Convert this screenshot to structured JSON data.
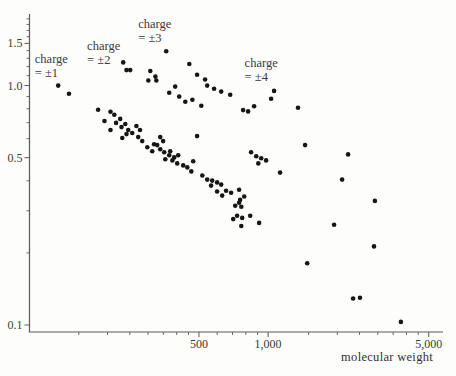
{
  "figure": {
    "background": "#fdfdfb",
    "dot_color": "#161616",
    "axis_color": "#5a5a5a",
    "text_color": "#3a3a3a"
  },
  "chart_data": {
    "type": "scatter",
    "scale": "log-log",
    "title": "",
    "xlabel": "molecular weight",
    "ylabel": "",
    "xlim": [
      91.5,
      5770
    ],
    "ylim": [
      0.0935,
      1.99
    ],
    "grid": false,
    "x_ticks": {
      "major": [
        {
          "value": 500,
          "label": "500"
        },
        {
          "value": 1000,
          "label": "1,000"
        },
        {
          "value": 5000,
          "label": "5,000"
        }
      ],
      "minor": [
        150,
        200,
        250,
        300,
        350,
        400,
        450,
        600,
        700,
        800,
        900,
        1500,
        2000,
        2500,
        3000,
        3500,
        4000,
        4500
      ]
    },
    "y_ticks": {
      "major": [
        {
          "value": 1.5,
          "label": "1.5"
        },
        {
          "value": 1.0,
          "label": "1.0"
        },
        {
          "value": 0.5,
          "label": "0.5"
        },
        {
          "value": 0.1,
          "label": "0.1"
        }
      ],
      "minor": [
        0.2,
        0.3,
        0.4,
        0.6,
        0.7,
        0.8,
        0.9,
        1.1,
        1.2,
        1.3,
        1.4,
        1.6,
        1.7,
        1.8,
        1.9
      ]
    },
    "annotations": [
      {
        "lines": [
          "charge",
          "= ±1"
        ],
        "x": 96.5,
        "y": 1.37
      },
      {
        "lines": [
          "charge",
          "= ±2"
        ],
        "x": 163,
        "y": 1.55
      },
      {
        "lines": [
          "charge",
          "= ±3"
        ],
        "x": 272,
        "y": 1.92
      },
      {
        "lines": [
          "charge",
          "= ±4"
        ],
        "x": 790,
        "y": 1.32
      }
    ],
    "series": [
      {
        "name": "charge ±1",
        "points": [
          [
            122,
            1.0
          ],
          [
            136,
            0.925
          ],
          [
            182,
            0.792
          ],
          [
            206,
            0.777
          ],
          [
            214,
            0.755
          ],
          [
            194,
            0.711
          ],
          [
            227,
            0.726
          ],
          [
            218,
            0.698
          ],
          [
            239,
            0.691
          ],
          [
            206,
            0.652
          ],
          [
            230,
            0.671
          ],
          [
            246,
            0.652
          ],
          [
            242,
            0.627
          ],
          [
            232,
            0.604
          ],
          [
            256,
            0.634
          ],
          [
            267,
            0.678
          ],
          [
            277,
            0.652
          ],
          [
            272,
            0.609
          ],
          [
            283,
            0.586
          ],
          [
            298,
            0.553
          ],
          [
            329,
            0.564
          ],
          [
            313,
            0.532
          ],
          [
            339,
            0.609
          ],
          [
            319,
            0.569
          ],
          [
            339,
            0.542
          ],
          [
            349,
            0.586
          ],
          [
            353,
            0.527
          ],
          [
            375,
            0.532
          ],
          [
            357,
            0.492
          ],
          [
            371,
            0.512
          ],
          [
            390,
            0.501
          ],
          [
            406,
            0.512
          ],
          [
            402,
            0.473
          ],
          [
            383,
            0.487
          ],
          [
            427,
            0.464
          ],
          [
            445,
            0.455
          ],
          [
            472,
            0.483
          ],
          [
            463,
            0.438
          ],
          [
            517,
            0.421
          ],
          [
            543,
            0.405
          ],
          [
            571,
            0.401
          ],
          [
            565,
            0.382
          ],
          [
            600,
            0.394
          ],
          [
            625,
            0.386
          ],
          [
            600,
            0.361
          ],
          [
            631,
            0.347
          ],
          [
            656,
            0.364
          ],
          [
            690,
            0.357
          ],
          [
            748,
            0.367
          ],
          [
            755,
            0.333
          ],
          [
            787,
            0.344
          ],
          [
            748,
            0.324
          ],
          [
            719,
            0.315
          ],
          [
            764,
            0.312
          ],
          [
            733,
            0.286
          ],
          [
            771,
            0.28
          ],
          [
            705,
            0.277
          ],
          [
            836,
            0.286
          ],
          [
            764,
            0.259
          ],
          [
            914,
            0.267
          ]
        ]
      },
      {
        "name": "charge ±2",
        "points": [
          [
            234,
            1.25
          ],
          [
            242,
            1.16
          ],
          [
            251,
            1.16
          ],
          [
            301,
            1.05
          ],
          [
            326,
            1.05
          ],
          [
            394,
            0.99
          ],
          [
            371,
            0.934
          ],
          [
            410,
            0.899
          ],
          [
            436,
            0.856
          ],
          [
            468,
            0.873
          ],
          [
            512,
            0.824
          ],
          [
            491,
            0.615
          ],
          [
            843,
            0.527
          ],
          [
            887,
            0.507
          ],
          [
            933,
            0.497
          ],
          [
            906,
            0.473
          ],
          [
            980,
            0.487
          ],
          [
            1128,
            0.433
          ]
        ]
      },
      {
        "name": "charge ±3",
        "points": [
          [
            360,
            1.39
          ],
          [
            307,
            1.15
          ],
          [
            323,
            1.09
          ],
          [
            454,
            1.23
          ],
          [
            491,
            1.11
          ],
          [
            532,
            1.06
          ],
          [
            543,
            1.0
          ],
          [
            582,
            0.97
          ],
          [
            625,
            0.944
          ],
          [
            684,
            0.916
          ],
          [
            778,
            0.79
          ],
          [
            818,
            0.78
          ],
          [
            869,
            0.82
          ],
          [
            1349,
            0.808
          ],
          [
            1449,
            0.564
          ],
          [
            2228,
            0.516
          ]
        ]
      },
      {
        "name": "charge ±4",
        "points": [
          [
            1062,
            0.95
          ],
          [
            1030,
            0.881
          ],
          [
            2099,
            0.405
          ],
          [
            2917,
            0.33
          ],
          [
            1937,
            0.262
          ],
          [
            2891,
            0.213
          ],
          [
            1479,
            0.181
          ],
          [
            2344,
            0.129
          ],
          [
            2512,
            0.13
          ],
          [
            3784,
            0.103
          ]
        ]
      }
    ]
  }
}
